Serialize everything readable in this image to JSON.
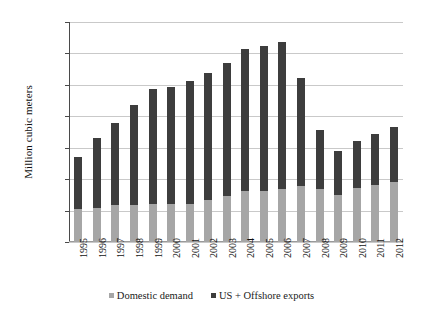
{
  "chart_data": {
    "type": "bar",
    "stacked": true,
    "title": "",
    "xlabel": "",
    "ylabel": "Million cubic meters",
    "ylim": [
      0.0,
      14.0
    ],
    "ytick_step": 2.0,
    "ytick_labels": [
      "14.00",
      "12.00",
      "10.00",
      "8.00",
      "6.00",
      "4.00",
      "2.00",
      "0.00"
    ],
    "ytick_values": [
      14.0,
      12.0,
      10.0,
      8.0,
      6.0,
      4.0,
      2.0,
      0.0
    ],
    "grid": true,
    "grid_axis": "y",
    "legend_position": "bottom",
    "categories": [
      "1995",
      "1996",
      "1997",
      "1998",
      "1999",
      "2000",
      "2001",
      "2002",
      "2003",
      "2004",
      "2005",
      "2006",
      "2007",
      "2008",
      "2009",
      "2010",
      "2011",
      "2012"
    ],
    "series": [
      {
        "name": "Domestic demand",
        "color": "#a6a6a6",
        "values": [
          2.1,
          2.15,
          2.35,
          2.35,
          2.4,
          2.4,
          2.4,
          2.7,
          2.95,
          3.25,
          3.25,
          3.35,
          3.55,
          3.4,
          3.0,
          3.45,
          3.6,
          3.85
        ]
      },
      {
        "name": "US + Offshore exports",
        "color": "#3d3d3d",
        "values": [
          3.3,
          4.45,
          5.25,
          6.4,
          7.35,
          7.45,
          7.85,
          8.05,
          8.45,
          9.05,
          9.25,
          9.35,
          6.9,
          3.75,
          2.8,
          2.95,
          3.25,
          3.5
        ]
      }
    ],
    "totals": [
      5.4,
      6.6,
      7.6,
      8.75,
      9.75,
      9.85,
      10.25,
      10.75,
      11.4,
      12.3,
      12.5,
      12.7,
      10.45,
      7.15,
      5.8,
      6.4,
      6.85,
      7.35
    ]
  },
  "legend": {
    "items": [
      {
        "label": "Domestic demand",
        "swatch": "legend-swatch-domestic"
      },
      {
        "label": "US + Offshore exports",
        "swatch": "legend-swatch-exports"
      }
    ]
  }
}
